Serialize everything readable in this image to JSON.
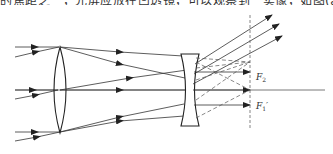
{
  "caption": {
    "text": "的焦距之一，光屏应放在凹透镜，可以观察到一实像，如图(a)所示，"
  },
  "diagram": {
    "elements": {
      "convex_lens": "convex-lens",
      "concave_lens": "concave-lens",
      "principal_axis": "optical-axis",
      "focal_plane": "dashed-vertical-focal-plane"
    },
    "labels": {
      "f2": {
        "main": "F",
        "sub": "2",
        "prime": ""
      },
      "f1p": {
        "main": "F",
        "sub": "1",
        "prime": "′"
      }
    },
    "colors": {
      "line": "#333333",
      "dash": "#555555"
    }
  }
}
